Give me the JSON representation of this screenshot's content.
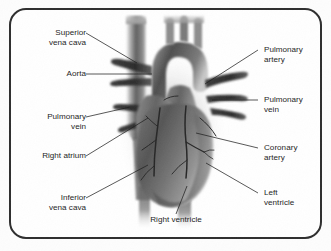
{
  "figure": {
    "border_color": "#2e2e2e",
    "background_color": "#ffffff",
    "text_color": "#1c1c1c"
  },
  "labels": [
    {
      "id": "superior-vena-cava",
      "text": "Superior\nvena cava",
      "side": "left"
    },
    {
      "id": "aorta",
      "text": "Aorta",
      "side": "left"
    },
    {
      "id": "pulmonary-vein-left",
      "text": "Pulmonary\nvein",
      "side": "left"
    },
    {
      "id": "right-atrium",
      "text": "Right atrium",
      "side": "left"
    },
    {
      "id": "inferior-vena-cava",
      "text": "Inferior\nvena cava",
      "side": "left"
    },
    {
      "id": "pulmonary-artery",
      "text": "Pulmonary\nartery",
      "side": "right"
    },
    {
      "id": "pulmonary-vein-right",
      "text": "Pulmonary\nvein",
      "side": "right"
    },
    {
      "id": "coronary-artery",
      "text": "Coronary\nartery",
      "side": "right"
    },
    {
      "id": "left-ventricle",
      "text": "Left\nventricle",
      "side": "right"
    },
    {
      "id": "right-ventricle",
      "text": "Right ventricle",
      "side": "bottom"
    }
  ]
}
